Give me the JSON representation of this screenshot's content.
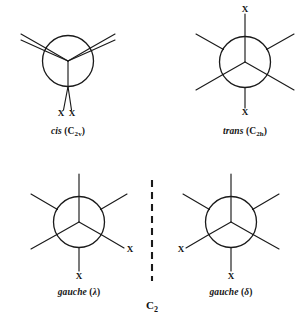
{
  "figure": {
    "overall_point_group_label": "C",
    "overall_point_group_sub": "2",
    "stroke_color": "#1a1a1a",
    "background_color": "#ffffff"
  },
  "structures": [
    {
      "id": "cis",
      "caption_name": "cis",
      "caption_point_group_open": " (C",
      "caption_point_group_sub": "2v",
      "caption_point_group_close": ")",
      "substituent_labels": [
        "X",
        "X"
      ],
      "conformation": "eclipsed",
      "description": "Newman projection with eclipsed bonds, two X substituents at the bottom"
    },
    {
      "id": "trans",
      "caption_name": "trans",
      "caption_point_group_open": " (C",
      "caption_point_group_sub": "2h",
      "caption_point_group_close": ")",
      "substituent_labels": [
        "X",
        "X"
      ],
      "conformation": "staggered-anti",
      "description": "Newman projection with X at top and X at bottom"
    },
    {
      "id": "gauche-lambda",
      "caption_name": "gauche",
      "caption_point_group_open": " (",
      "caption_point_group_sub": "",
      "caption_symbol": "λ",
      "caption_point_group_close": ")",
      "substituent_labels": [
        "X",
        "X"
      ],
      "conformation": "staggered-gauche",
      "description": "Newman projection with X at lower right and X at bottom"
    },
    {
      "id": "gauche-delta",
      "caption_name": "gauche",
      "caption_point_group_open": " (",
      "caption_point_group_sub": "",
      "caption_symbol": "δ",
      "caption_point_group_close": ")",
      "substituent_labels": [
        "X",
        "X"
      ],
      "conformation": "staggered-gauche",
      "description": "Newman projection with X at lower left and X at bottom"
    }
  ],
  "divider": {
    "style": "dashed-vertical",
    "meaning": "mirror-plane between enantiomeric gauche forms"
  }
}
